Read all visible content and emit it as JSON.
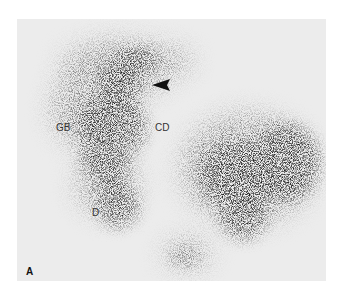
{
  "figure": {
    "panel_label": "A",
    "annotations": [
      {
        "id": "gb",
        "text": "GB"
      },
      {
        "id": "cd",
        "text": "CD"
      },
      {
        "id": "d",
        "text": "D"
      }
    ],
    "arrowhead": {
      "direction": "left"
    },
    "colors": {
      "background": "#ffffff",
      "panel": "#ececec",
      "activity": "#111111"
    }
  }
}
